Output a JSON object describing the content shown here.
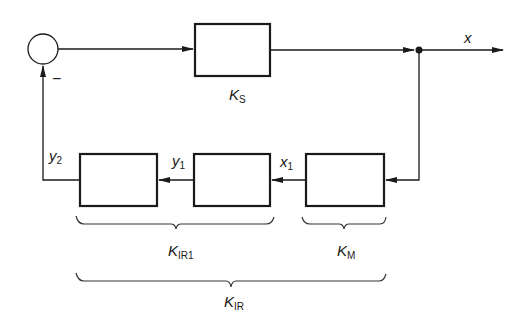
{
  "diagram": {
    "type": "block-diagram",
    "summing_junction": {
      "sign_feedback": "−"
    },
    "blocks": [
      {
        "id": "KS",
        "label": "K",
        "subscript": "S"
      },
      {
        "id": "KIR1_a",
        "label": "",
        "subscript": ""
      },
      {
        "id": "KIR1_b",
        "label": "",
        "subscript": ""
      },
      {
        "id": "KM",
        "label": "",
        "subscript": ""
      }
    ],
    "signals": {
      "output": {
        "label": "x",
        "subscript": ""
      },
      "x1": {
        "label": "x",
        "subscript": "1"
      },
      "y1": {
        "label": "y",
        "subscript": "1"
      },
      "y2": {
        "label": "y",
        "subscript": "2"
      }
    },
    "braces": {
      "KIR1": {
        "label": "K",
        "subscript": "IR1"
      },
      "KM": {
        "label": "K",
        "subscript": "M"
      },
      "KIR": {
        "label": "K",
        "subscript": "IR"
      }
    },
    "block_label_KS": {
      "label": "K",
      "subscript": "S"
    }
  }
}
